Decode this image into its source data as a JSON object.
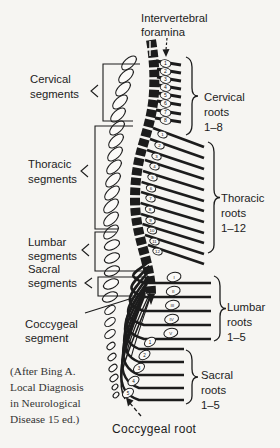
{
  "figure_title": "Spinal cord segments and nerve roots (vertebral column relationship)",
  "labels": {
    "foramina": [
      "Intervertebral",
      "foramina"
    ],
    "cervical_segments": [
      "Cervical",
      "segments"
    ],
    "thoracic_segments": [
      "Thoracic",
      "segments"
    ],
    "lumbar_segments": [
      "Lumbar",
      "segments"
    ],
    "sacral_segments": [
      "Sacral",
      "segments"
    ],
    "coccygeal_segment": [
      "Coccygeal",
      "segment"
    ],
    "cervical_roots": [
      "Cervical",
      "roots",
      "1–8"
    ],
    "thoracic_roots": [
      "Thoracic",
      "roots",
      "1–12"
    ],
    "lumbar_roots": [
      "Lumbar",
      "roots",
      "1–5"
    ],
    "sacral_roots": [
      "Sacral",
      "roots",
      "1–5"
    ],
    "coccygeal_root": "Coccygeal root"
  },
  "citation": [
    "(After Bing A.",
    "Local Diagnosis",
    "in Neurological",
    "Disease 15 ed.)"
  ],
  "ganglia": {
    "cervical": [
      "1",
      "2",
      "3",
      "4",
      "5",
      "6",
      "7",
      "8"
    ],
    "thoracic": [
      "1",
      "2",
      "3",
      "4",
      "5",
      "6",
      "7",
      "8",
      "9",
      "10",
      "11",
      "12"
    ],
    "lumbar": [
      "I",
      "II",
      "III",
      "IV",
      "V"
    ],
    "sacral": [
      "1",
      "2",
      "3",
      "4",
      "5"
    ]
  },
  "colors": {
    "ink": "#1c1c1c",
    "paper": "#f6f5f2"
  }
}
